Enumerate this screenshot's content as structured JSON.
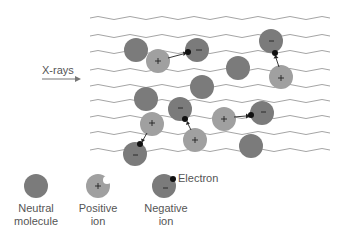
{
  "incoming_label": "X-rays",
  "legend": {
    "neutral": {
      "line1": "Neutral",
      "line2": "molecule"
    },
    "positive": {
      "line1": "Positive",
      "line2": "ion"
    },
    "negative": {
      "line1": "Negative",
      "line2": "ion"
    },
    "electron": "Electron"
  },
  "colors": {
    "neutral": "#7b7b7b",
    "positive_ion": "#a0a0a0",
    "negative_ion": "#7b7b7b",
    "electron": "#111111",
    "waves": "#9a9a9a"
  },
  "wave_lines_y": [
    18,
    36,
    52,
    70,
    86,
    101,
    117,
    133,
    150
  ],
  "particles": [
    {
      "type": "neutral",
      "cx": 136,
      "cy": 50
    },
    {
      "type": "positive",
      "cx": 158,
      "cy": 61
    },
    {
      "type": "negative",
      "cx": 197,
      "cy": 50
    },
    {
      "type": "negative",
      "cx": 271,
      "cy": 41
    },
    {
      "type": "positive",
      "cx": 281,
      "cy": 77
    },
    {
      "type": "neutral",
      "cx": 238,
      "cy": 68
    },
    {
      "type": "neutral",
      "cx": 202,
      "cy": 87
    },
    {
      "type": "neutral",
      "cx": 146,
      "cy": 99
    },
    {
      "type": "negative",
      "cx": 180,
      "cy": 109
    },
    {
      "type": "positive",
      "cx": 152,
      "cy": 124
    },
    {
      "type": "negative",
      "cx": 135,
      "cy": 154
    },
    {
      "type": "positive",
      "cx": 195,
      "cy": 140
    },
    {
      "type": "positive",
      "cx": 224,
      "cy": 119
    },
    {
      "type": "negative",
      "cx": 262,
      "cy": 113
    },
    {
      "type": "neutral",
      "cx": 251,
      "cy": 146
    }
  ]
}
